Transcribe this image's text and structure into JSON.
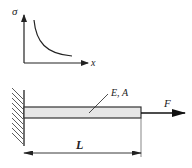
{
  "graph": {
    "y_axis_label": "σ",
    "x_axis_label": "x",
    "curve": "decreasing hyperbolic stress vs position"
  },
  "bar": {
    "property_label": "E, A",
    "length_label": "L",
    "force_label": "F",
    "fill_color": "#e6e6e6",
    "stroke_color": "#333333"
  },
  "support": {
    "type": "fixed wall (hatched)"
  }
}
